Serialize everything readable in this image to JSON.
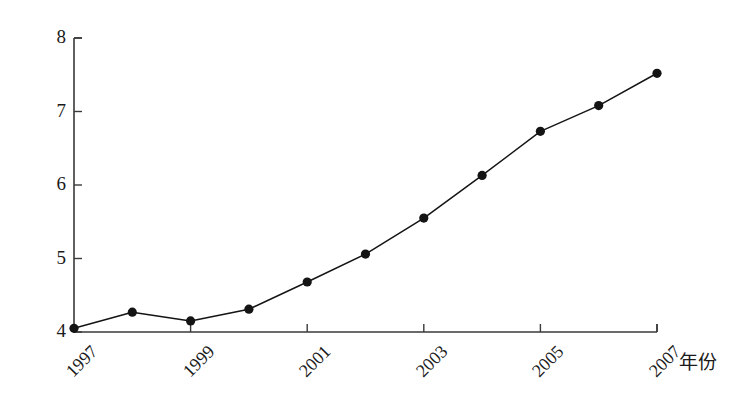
{
  "chart_data": {
    "type": "line",
    "title": "",
    "subtitle": "",
    "xlabel": "年份",
    "ylabel": "",
    "x": [
      1997,
      1998,
      1999,
      2000,
      2001,
      2002,
      2003,
      2004,
      2005,
      2006,
      2007
    ],
    "categories": [
      "1997",
      "1998",
      "1999",
      "2000",
      "2001",
      "2002",
      "2003",
      "2004",
      "2005",
      "2006",
      "2007"
    ],
    "values": [
      4.05,
      4.27,
      4.15,
      4.31,
      4.68,
      5.06,
      5.55,
      6.13,
      6.73,
      7.08,
      7.52
    ],
    "series": [
      {
        "name": "",
        "values": [
          4.05,
          4.27,
          4.15,
          4.31,
          4.68,
          5.06,
          5.55,
          6.13,
          6.73,
          7.08,
          7.52
        ]
      }
    ],
    "xlim": [
      1997,
      2007
    ],
    "ylim": [
      4,
      8
    ],
    "x_tick_labels": [
      "1997",
      "1999",
      "2001",
      "2003",
      "2005",
      "2007"
    ],
    "x_tick_values": [
      1997,
      1999,
      2001,
      2003,
      2005,
      2007
    ],
    "y_tick_labels": [
      "4",
      "5",
      "6",
      "7",
      "8"
    ],
    "y_tick_values": [
      4,
      5,
      6,
      7,
      8
    ],
    "grid": false,
    "legend": false,
    "legend_position": "none",
    "marker": "filled-circle",
    "line_color": "#141414",
    "marker_color": "#141414",
    "axis_color": "#3a3a3a",
    "background_color": "#ffffff",
    "x_label_rotation_deg": -45,
    "annotations": []
  },
  "axis": {
    "x_title": "年份"
  }
}
